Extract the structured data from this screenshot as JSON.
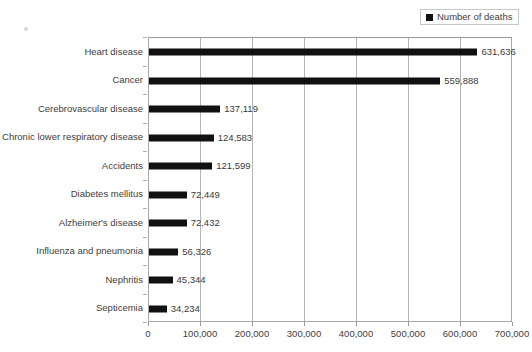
{
  "legend": {
    "swatch_color": "#111111",
    "label": "Number of deaths"
  },
  "axis": {
    "x_ticks": [
      "0",
      "100,000",
      "200,000",
      "300,000",
      "400,000",
      "500,000",
      "600,000",
      "700,000"
    ]
  },
  "chart_data": {
    "type": "bar",
    "orientation": "horizontal",
    "title": "",
    "xlabel": "",
    "ylabel": "",
    "xlim": [
      0,
      700000
    ],
    "grid": true,
    "legend_position": "top-right",
    "categories": [
      "Heart disease",
      "Cancer",
      "Cerebrovascular disease",
      "Chronic lower respiratory disease",
      "Accidents",
      "Diabetes mellitus",
      "Alzheimer's disease",
      "Influenza and pneumonia",
      "Nephritis",
      "Septicemia"
    ],
    "values": [
      631636,
      559888,
      137119,
      124583,
      121599,
      72449,
      72432,
      56326,
      45344,
      34234
    ],
    "value_labels": [
      "631,636",
      "559,888",
      "137,119",
      "124,583",
      "121,599",
      "72,449",
      "72,432",
      "56,326",
      "45,344",
      "34,234"
    ],
    "series": [
      {
        "name": "Number of deaths",
        "color": "#111111",
        "values": [
          631636,
          559888,
          137119,
          124583,
          121599,
          72449,
          72432,
          56326,
          45344,
          34234
        ]
      }
    ]
  }
}
